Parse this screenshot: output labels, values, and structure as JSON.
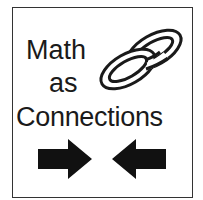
{
  "logo": {
    "line1": "Math",
    "line2": "as",
    "line3": "Connections",
    "icons": {
      "chain": "chain-links-icon",
      "arrow_right": "arrow-right-icon",
      "arrow_left": "arrow-left-icon"
    },
    "colors": {
      "ink": "#1a1a1a",
      "border": "#333333",
      "background": "#ffffff"
    }
  }
}
